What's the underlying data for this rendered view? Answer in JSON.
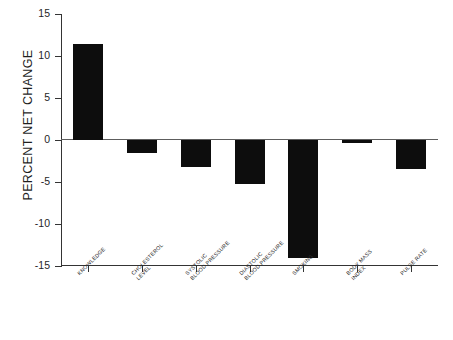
{
  "chart_data": {
    "type": "bar",
    "title": "",
    "subtitle": "",
    "xlabel": "",
    "ylabel": "PERCENT NET CHANGE",
    "ylim": [
      -15,
      15
    ],
    "yticks": [
      15,
      10,
      5,
      0,
      -5,
      -10,
      -15
    ],
    "ytick_labels": [
      "15",
      "10",
      "5",
      "0",
      "-5",
      "-10",
      "-15"
    ],
    "grid": false,
    "legend": null,
    "bar_color": "#0d0d0d",
    "zero_line": 0,
    "categories": [
      "KNOWLEDGE",
      "CHOLESTEROL LEVEL",
      "SYSTOLIC BLOOD PRESSURE",
      "DIASTOLIC BLOOD PRESSURE",
      "SMOKING",
      "BODY MASS INDEX",
      "PULSE RATE"
    ],
    "category_lines": [
      [
        "KNOWLEDGE"
      ],
      [
        "CHOLESTEROL",
        "LEVEL"
      ],
      [
        "SYSTOLIC",
        "BLOOD PRESSURE"
      ],
      [
        "DIASTOLIC",
        "BLOOD PRESSURE"
      ],
      [
        "SMOKING"
      ],
      [
        "BODY MASS",
        "INDEX"
      ],
      [
        "PULSE RATE"
      ]
    ],
    "values": [
      11.4,
      -1.6,
      -3.2,
      -5.2,
      -14.0,
      -0.3,
      -3.4
    ]
  }
}
